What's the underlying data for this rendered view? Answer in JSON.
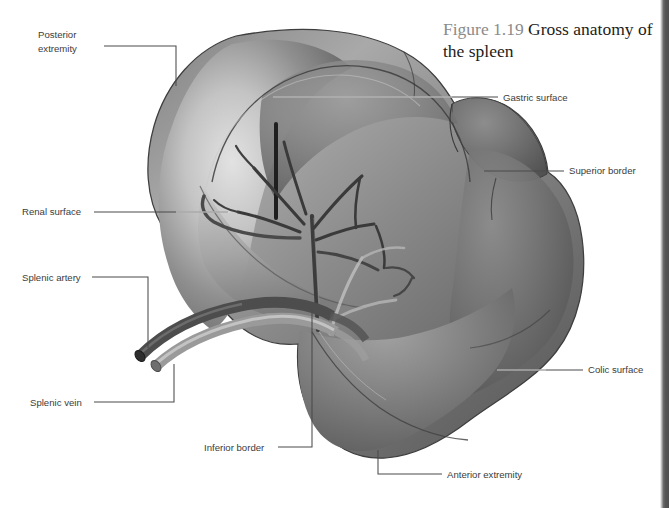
{
  "figure": {
    "number": "Figure 1.19",
    "title": "Gross anatomy of the spleen",
    "background_color": "#ffffff",
    "label_color": "#3c3c3c",
    "leader_color": "#4a4a4a",
    "organ_dark": "#5a5a5a",
    "organ_mid": "#8e8e8e",
    "organ_light": "#d2d2d2",
    "artery_color": "#4b4b4b",
    "vein_color": "#a8a8a8"
  },
  "labels": [
    {
      "id": "posterior-extremity",
      "text": "Posterior\nextremity",
      "x": 38,
      "y": 28
    },
    {
      "id": "renal-surface",
      "text": "Renal surface",
      "x": 22,
      "y": 205
    },
    {
      "id": "splenic-artery",
      "text": "Splenic artery",
      "x": 22,
      "y": 271
    },
    {
      "id": "splenic-vein",
      "text": "Splenic vein",
      "x": 30,
      "y": 396
    },
    {
      "id": "inferior-border",
      "text": "Inferior border",
      "x": 204,
      "y": 441
    },
    {
      "id": "anterior-extremity",
      "text": "Anterior extremity",
      "x": 447,
      "y": 468
    },
    {
      "id": "gastric-surface",
      "text": "Gastric surface",
      "x": 503,
      "y": 91
    },
    {
      "id": "superior-border",
      "text": "Superior border",
      "x": 569,
      "y": 164
    },
    {
      "id": "colic-surface",
      "text": "Colic surface",
      "x": 588,
      "y": 363
    }
  ]
}
